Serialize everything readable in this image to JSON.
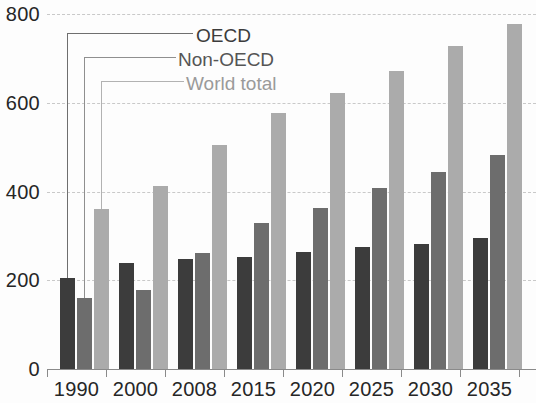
{
  "chart_data": {
    "type": "bar",
    "title": "",
    "subtitle": "",
    "xlabel": "",
    "ylabel": "",
    "categories": [
      "1990",
      "2000",
      "2008",
      "2015",
      "2020",
      "2025",
      "2030",
      "2035"
    ],
    "series": [
      {
        "name": "OECD",
        "color": "#3c3c3c",
        "values": [
          205,
          238,
          248,
          253,
          264,
          274,
          282,
          295
        ]
      },
      {
        "name": "Non-OECD",
        "color": "#6d6d6d",
        "values": [
          160,
          178,
          262,
          330,
          363,
          408,
          443,
          483
        ]
      },
      {
        "name": "World total",
        "color": "#ababab",
        "values": [
          360,
          412,
          505,
          578,
          622,
          672,
          727,
          778
        ]
      }
    ],
    "ylim": [
      0,
      800
    ],
    "yticks": [
      "0",
      "200",
      "400",
      "600",
      "800"
    ],
    "ytick_values": [
      0,
      200,
      400,
      600,
      800
    ],
    "grid": true,
    "legend_position": "inside-upper-left-callout",
    "legend_style": "leader-lines-to-first-group"
  },
  "axes": {
    "y_labels": [
      "800",
      "600",
      "400",
      "200",
      "0"
    ],
    "x_labels": [
      "1990",
      "2000",
      "2008",
      "2015",
      "2020",
      "2025",
      "2030",
      "2035"
    ]
  },
  "legend": {
    "items": [
      {
        "label": "OECD"
      },
      {
        "label": "Non-OECD"
      },
      {
        "label": "World total"
      }
    ]
  }
}
